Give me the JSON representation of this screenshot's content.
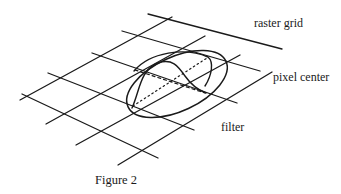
{
  "labels": {
    "raster_grid": "raster grid",
    "pixel_center": "pixel center",
    "filter": "filter"
  },
  "caption": "Figure 2",
  "colors": {
    "ink": "#1a1a1a",
    "background": "#ffffff"
  }
}
